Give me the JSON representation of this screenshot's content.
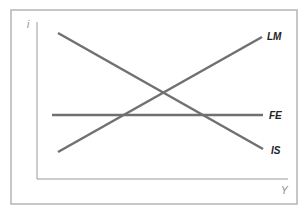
{
  "diagram": {
    "type": "IS-LM-FE",
    "axes": {
      "y_label": "i",
      "x_label": "Y"
    },
    "curves": [
      {
        "name": "LM",
        "label": "LM",
        "slope": "upward"
      },
      {
        "name": "FE",
        "label": "FE",
        "slope": "horizontal"
      },
      {
        "name": "IS",
        "label": "IS",
        "slope": "downward"
      }
    ],
    "colors": {
      "frame": "#b5b5b5",
      "axis": "#9a9a9a",
      "curve": "#707070",
      "label": "#222222"
    }
  }
}
